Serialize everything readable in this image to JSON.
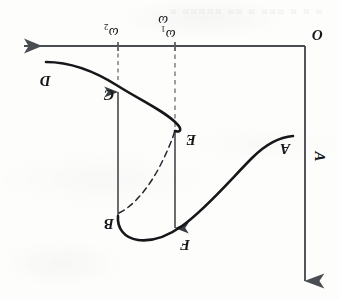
{
  "figure": {
    "kind": "amplitude-frequency-response-hysteresis",
    "orientation_note": "scanned page rotated 180 degrees; all lettering appears upside-down",
    "background_color": "#fdfdfc",
    "ink_color": "#15171a",
    "axis_color": "#4a4d52"
  },
  "axes": {
    "origin_label": "O",
    "horizontal": {
      "label": "ω",
      "arrow_direction": "left",
      "y": 46,
      "x_start": 15,
      "x_end": 305
    },
    "vertical": {
      "label": "A",
      "arrow_direction": "down",
      "x": 305,
      "y_start": 46,
      "y_end": 290
    }
  },
  "ticks": [
    {
      "id": "tick-omega2",
      "label": "ω",
      "sub": "2",
      "x": 118
    },
    {
      "id": "tick-omega1",
      "label": "ω",
      "sub": "1",
      "x": 175
    }
  ],
  "points": [
    {
      "id": "point-D",
      "label": "D",
      "x": 40,
      "y": 72
    },
    {
      "id": "point-C",
      "label": "C",
      "x": 104,
      "y": 86
    },
    {
      "id": "point-E",
      "label": "E",
      "x": 186,
      "y": 131
    },
    {
      "id": "point-B",
      "label": "B",
      "x": 104,
      "y": 215
    },
    {
      "id": "point-F",
      "label": "F",
      "x": 180,
      "y": 236
    },
    {
      "id": "point-A",
      "label": "A",
      "x": 280,
      "y": 140
    }
  ],
  "jump_lines": [
    {
      "id": "jump-up-at-omega2",
      "from": "B",
      "to": "C",
      "x": 118,
      "y_top": 46,
      "y_bottom": 216,
      "style": "solid",
      "arrow": "up"
    },
    {
      "id": "jump-down-at-omega1",
      "from": "E",
      "to": "F",
      "x": 175,
      "y_top": 46,
      "y_bottom": 232,
      "style": "dashed-above-E-solid-below",
      "arrow": "down"
    }
  ],
  "curves": [
    {
      "id": "upper-branch-DCE",
      "style": "solid",
      "description": "upper stable branch from D through C bending back at the nose to E"
    },
    {
      "id": "lower-branch-FA",
      "style": "solid",
      "description": "lower stable branch from F rising rightward to A"
    },
    {
      "id": "unstable-branch-BE",
      "style": "dashed",
      "description": "unstable middle branch joining B to E"
    }
  ],
  "ghost_text": "≈ ≈ ≈   ≈≈≈  ≈ ≈≈ ≈≈≈≈≈  ≈"
}
